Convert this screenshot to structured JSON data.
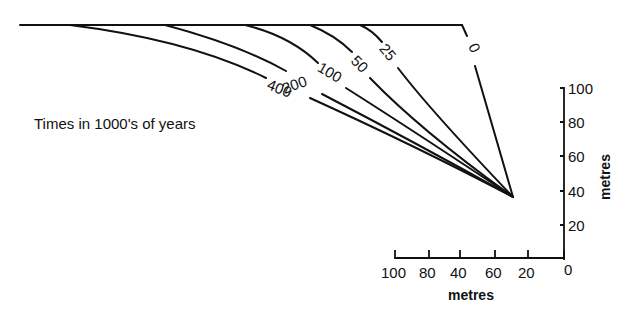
{
  "diagram": {
    "caption": "Times in 1000's of years",
    "isochrons": [
      {
        "label": "0"
      },
      {
        "label": "25"
      },
      {
        "label": "50"
      },
      {
        "label": "100"
      },
      {
        "label": "200"
      },
      {
        "label": "400"
      }
    ],
    "vertical_axis": {
      "label": "metres",
      "ticks": [
        "100",
        "80",
        "60",
        "40",
        "20",
        "0"
      ]
    },
    "horizontal_axis": {
      "label": "metres",
      "ticks": [
        "100",
        "80",
        "40",
        "60",
        "20"
      ]
    },
    "colors": {
      "ink": "#111111",
      "background": "#ffffff"
    }
  }
}
